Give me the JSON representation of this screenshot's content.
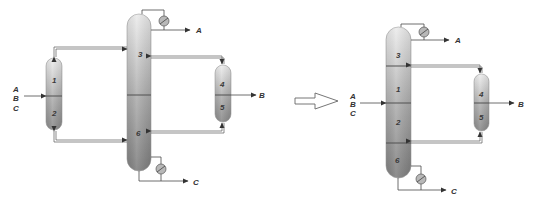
{
  "figure": {
    "transform_arrow": "hollow-right-arrow"
  },
  "left_diagram": {
    "feed_labels": [
      "A",
      "B",
      "C"
    ],
    "main_column": {
      "sections": [
        "3",
        "6"
      ]
    },
    "prefractionator": {
      "sections": [
        "1",
        "2"
      ]
    },
    "side_column": {
      "sections": [
        "4",
        "5"
      ]
    },
    "products": {
      "top": "A",
      "side": "B",
      "bottom": "C"
    },
    "condenser": "condenser-icon",
    "reboiler": "reboiler-icon"
  },
  "right_diagram": {
    "feed_labels": [
      "A",
      "B",
      "C"
    ],
    "main_column": {
      "sections": [
        "3",
        "1",
        "2",
        "6"
      ]
    },
    "side_column": {
      "sections": [
        "4",
        "5"
      ]
    },
    "products": {
      "top": "A",
      "side": "B",
      "bottom": "C"
    },
    "condenser": "condenser-icon",
    "reboiler": "reboiler-icon"
  },
  "colors": {
    "top_gradient": "#e8e8e8",
    "bottom_gradient": "#8a8a8a",
    "line": "#4a4a4a",
    "text": "#333333"
  }
}
